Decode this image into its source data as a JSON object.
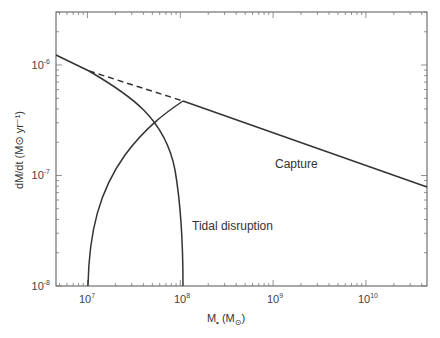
{
  "chart_data": {
    "type": "line",
    "title": "",
    "xlabel": "M• (M⊙)",
    "ylabel": "dM/dt (M⊙ yr⁻¹)",
    "x_scale": "log",
    "y_scale": "log",
    "xlim": [
      4500000.0,
      37000000000.0
    ],
    "ylim": [
      1e-08,
      3e-06
    ],
    "x_ticks": [
      "10^7",
      "10^8",
      "10^9",
      "10^10"
    ],
    "y_ticks": [
      "10^-8",
      "10^-7",
      "10^-6"
    ],
    "grid": false,
    "legend": null,
    "series": [
      {
        "name": "Capture",
        "style": "solid",
        "x": [
          4500000.0,
          100000000.0,
          37000000000.0
        ],
        "y": [
          1.15e-06,
          4.4e-07,
          7.5e-08
        ]
      },
      {
        "name": "Capture (extrapolated)",
        "style": "dashed",
        "x": [
          9000000.0,
          100000000.0
        ],
        "y": [
          8.3e-07,
          4.4e-07
        ]
      },
      {
        "name": "Tidal disruption (falling branch)",
        "style": "solid",
        "x": [
          9000000.0,
          20000000.0,
          40000000.0,
          60000000.0,
          80000000.0,
          100000000.0
        ],
        "y": [
          8.3e-07,
          6e-07,
          3.5e-07,
          1.6e-07,
          5e-08,
          1e-08
        ]
      },
      {
        "name": "Tidal disruption (rising branch)",
        "style": "solid",
        "x": [
          10000000.0,
          12000000.0,
          20000000.0,
          45000000.0,
          100000000.0
        ],
        "y": [
          1e-08,
          5e-08,
          1.5e-07,
          2.9e-07,
          4.4e-07
        ]
      }
    ],
    "annotations": [
      {
        "text": "Capture",
        "x": 2000000000.0,
        "y": 1.05e-07
      },
      {
        "text": "Tidal disruption",
        "x": 160000000.0,
        "y": 3.8e-08
      }
    ]
  },
  "labels": {
    "x_ticks": [
      {
        "base": "10",
        "exp": "7"
      },
      {
        "base": "10",
        "exp": "8"
      },
      {
        "base": "10",
        "exp": "9"
      },
      {
        "base": "10",
        "exp": "10"
      }
    ],
    "y_ticks": [
      {
        "base": "10",
        "exp": "-6"
      },
      {
        "base": "10",
        "exp": "-7"
      },
      {
        "base": "10",
        "exp": "-8"
      }
    ],
    "x_title_main": "M",
    "x_title_sub": "•",
    "x_title_unit": " (M",
    "x_title_unit_sub": "⊙",
    "x_title_close": ")",
    "y_title": "dM/dt (M⊙ yr⁻¹)",
    "capture": "Capture",
    "tidal": "Tidal disruption"
  }
}
